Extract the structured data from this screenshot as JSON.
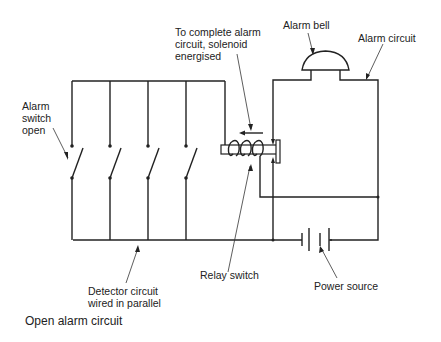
{
  "diagram": {
    "caption": "Open alarm circuit",
    "labels": {
      "solenoid_line1": "To complete alarm",
      "solenoid_line2": "circuit, solenoid",
      "solenoid_line3": "energised",
      "alarm_bell": "Alarm bell",
      "alarm_circuit": "Alarm circuit",
      "switch_line1": "Alarm",
      "switch_line2": "switch",
      "switch_line3": "open",
      "relay_switch": "Relay switch",
      "detector_line1": "Detector circuit",
      "detector_line2": "wired in parallel",
      "power_source": "Power source"
    },
    "components": [
      "detector-switches (4, parallel, open)",
      "solenoid relay",
      "alarm bell",
      "battery"
    ]
  }
}
